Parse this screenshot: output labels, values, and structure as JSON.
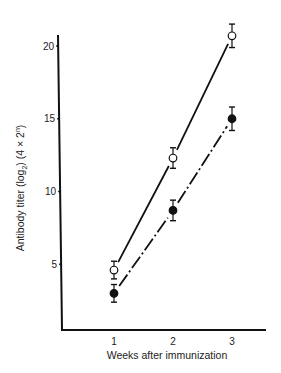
{
  "chart_data": {
    "type": "line",
    "title": "",
    "xlabel": "Weeks after immunization",
    "ylabel": "Antibody titer (log2) (4 × 2^n)",
    "ylabel_parts": {
      "main": "Antibody titer (log",
      "sub": "2",
      "mid": ") (4 × 2",
      "sup": "n",
      "end": ")"
    },
    "x": [
      1,
      2,
      3
    ],
    "x_ticks": [
      1,
      2,
      3
    ],
    "y_ticks": [
      5,
      10,
      15,
      20
    ],
    "ylim": [
      0.4,
      21
    ],
    "xlim": [
      0.15,
      3.6
    ],
    "grid": false,
    "legend": null,
    "series": [
      {
        "name": "open circles",
        "marker": "open-circle",
        "line": "solid",
        "values": [
          4.6,
          12.3,
          20.7
        ],
        "error": [
          0.4,
          0.5,
          0.6
        ]
      },
      {
        "name": "filled circles",
        "marker": "filled-circle",
        "line": "dash-dot",
        "values": [
          3.0,
          8.7,
          15.0
        ],
        "error": [
          0.4,
          0.5,
          0.6
        ]
      }
    ],
    "colors": {
      "axis": "#111111",
      "line": "#111111",
      "text": "#222222",
      "background": "#ffffff"
    }
  }
}
